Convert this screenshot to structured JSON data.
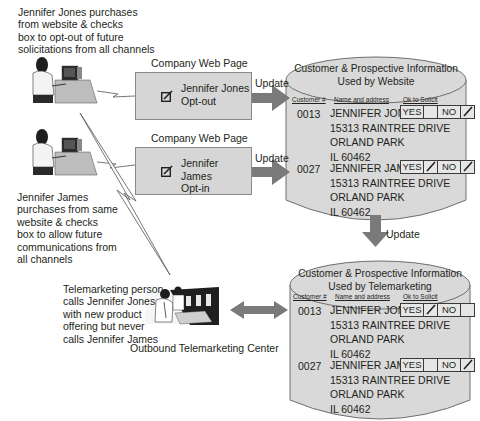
{
  "notes": {
    "jones": [
      "Jennifer Jones purchases",
      "from website & checks",
      "box to opt-out of future",
      "solicitations from all channels"
    ],
    "james": [
      "Jennifer James",
      "purchases from same",
      "website & checks",
      "box to allow future",
      "communications from",
      "all channels"
    ],
    "telemarketer": [
      "Telemarketing person",
      "calls Jennifer Jones",
      "with new product",
      "offering but never",
      "calls Jennifer James"
    ]
  },
  "web_pages": [
    {
      "title": "Company Web Page",
      "name": "Jennifer Jones",
      "choice": "Opt-out",
      "checkbox_icon": "checked-box-icon"
    },
    {
      "title": "Company Web Page",
      "name": "Jennifer James",
      "choice": "Opt-in",
      "checkbox_icon": "checked-box-icon"
    }
  ],
  "update_labels": {
    "web1": "Update",
    "web2": "Update",
    "db_sync": "Update"
  },
  "telemarketing_center": {
    "caption": "Outbound Telemarketing Center"
  },
  "columns": {
    "id": "Customer #",
    "name": "Name and address",
    "solicit": "Ok to Solicit"
  },
  "databases": [
    {
      "title_line1": "Customer & Prospective Information",
      "title_line2": "Used by Website",
      "records": [
        {
          "id": "0013",
          "address": [
            "JENNIFER JONES",
            "15313 RAINTREE DRIVE",
            "ORLAND PARK",
            "IL 60462"
          ],
          "yes_label": "YES",
          "no_label": "NO",
          "yes_checked": false,
          "no_checked": true
        },
        {
          "id": "0027",
          "address": [
            "JENNIFER JAMES",
            "15313 RAINTREE DRIVE",
            "ORLAND PARK",
            "IL 60462"
          ],
          "yes_label": "YES",
          "no_label": "NO",
          "yes_checked": true,
          "no_checked": true
        }
      ]
    },
    {
      "title_line1": "Customer & Prospective Information",
      "title_line2": "Used by Telemarketing",
      "records": [
        {
          "id": "0013",
          "address": [
            "JENNIFER JONES",
            "15313 RAINTREE DRIVE",
            "ORLAND PARK",
            "IL 60462"
          ],
          "yes_label": "YES",
          "no_label": "NO",
          "yes_checked": true,
          "no_checked": false
        },
        {
          "id": "0027",
          "address": [
            "JENNIFER JAMES",
            "15313 RAINTREE DRIVE",
            "ORLAND PARK",
            "IL 60462"
          ],
          "yes_label": "YES",
          "no_label": "NO",
          "yes_checked": false,
          "no_checked": true
        }
      ]
    }
  ],
  "colors": {
    "box_fill": "#d6d6d6",
    "db_fill": "#d9d9d9",
    "arrow": "#7a7a7a",
    "text": "#231f20"
  }
}
